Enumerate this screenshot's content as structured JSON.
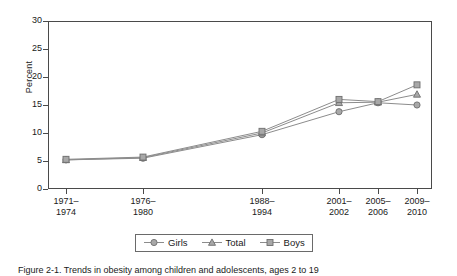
{
  "chart_data": {
    "type": "line",
    "title": "",
    "xlabel": "",
    "ylabel": "Percent",
    "ylim": [
      0,
      30
    ],
    "yticks": [
      0,
      5,
      10,
      15,
      20,
      25,
      30
    ],
    "ytick_labels": [
      "0",
      "5",
      "10",
      "15",
      "20",
      "25",
      "30"
    ],
    "grid": false,
    "legend_position": "bottom-center",
    "categories": [
      "1971–\n1974",
      "1976–\n1980",
      "1988–\n1994",
      "2001–\n2002",
      "2005–\n2006",
      "2009–\n2010"
    ],
    "category_lines": [
      [
        "1971–",
        "1974"
      ],
      [
        "1976–",
        "1980"
      ],
      [
        "1988–",
        "1994"
      ],
      [
        "2001–",
        "2002"
      ],
      [
        "2005–",
        "2006"
      ],
      [
        "2009–",
        "2010"
      ]
    ],
    "series": [
      {
        "name": "Girls",
        "marker": "circle",
        "color": "#8c8c8c",
        "values": [
          5.2,
          5.5,
          9.7,
          13.8,
          15.4,
          15.0
        ]
      },
      {
        "name": "Total",
        "marker": "triangle",
        "color": "#8c8c8c",
        "values": [
          5.2,
          5.6,
          10.0,
          15.4,
          15.5,
          16.9
        ]
      },
      {
        "name": "Boys",
        "marker": "square",
        "color": "#8c8c8c",
        "values": [
          5.3,
          5.7,
          10.3,
          16.0,
          15.6,
          18.6
        ]
      }
    ]
  },
  "legend": {
    "entries": [
      {
        "label": "Girls",
        "marker": "circle-marker"
      },
      {
        "label": "Total",
        "marker": "triangle-marker"
      },
      {
        "label": "Boys",
        "marker": "square-marker"
      }
    ]
  },
  "caption": {
    "text": "Figure 2-1. Trends in obesity among children and adolescents, ages 2 to 19"
  },
  "colors": {
    "axis": "#4a4a4a",
    "line": "#8c8c8c",
    "marker_fill": "#a8a8a8",
    "marker_edge": "#6e6e6e",
    "background": "#ffffff"
  }
}
